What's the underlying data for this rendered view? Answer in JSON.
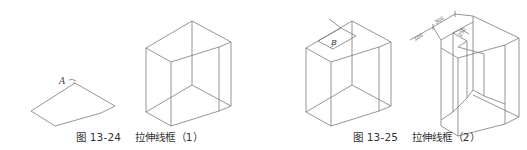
{
  "figures": [
    {
      "id": "13-24",
      "label": "图 13-24",
      "title": "拉伸线框（1）",
      "point_label": "A"
    },
    {
      "id": "13-25",
      "label": "图 13-25",
      "title": "拉伸线框（2）",
      "point_label": "B",
      "dimensions": [
        "100",
        "300",
        "250"
      ]
    }
  ],
  "colors": {
    "line": "#7a7a7a",
    "text": "#333333",
    "background": "#ffffff"
  }
}
